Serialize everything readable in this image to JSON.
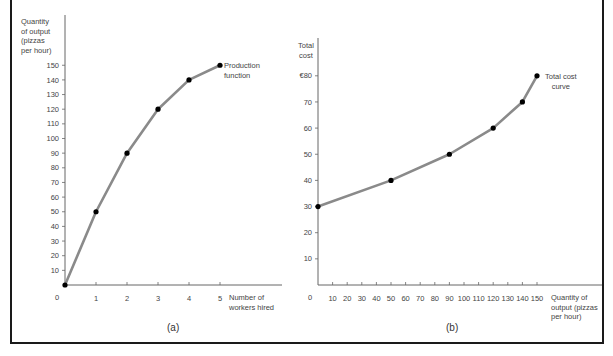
{
  "chart_data": [
    {
      "type": "line",
      "panel": "(a)",
      "title": "",
      "xlabel": "Number of workers hired",
      "ylabel": "Quantity of output (pizzas per hour)",
      "x": [
        0,
        1,
        2,
        3,
        4,
        5
      ],
      "series": [
        {
          "name": "Production function",
          "values": [
            0,
            50,
            90,
            120,
            140,
            150
          ]
        }
      ],
      "x_ticks": [
        "0",
        "1",
        "2",
        "3",
        "4",
        "5"
      ],
      "y_ticks": [
        "10",
        "20",
        "30",
        "40",
        "50",
        "60",
        "70",
        "80",
        "90",
        "100",
        "110",
        "120",
        "130",
        "140",
        "150"
      ],
      "xlim": [
        0,
        6.5
      ],
      "ylim": [
        0,
        160
      ],
      "annotations": [
        "Production function"
      ],
      "grid": false,
      "line_color": "#8a8a8a",
      "marker_color": "#000000"
    },
    {
      "type": "line",
      "panel": "(b)",
      "title": "",
      "xlabel": "Quantity of output (pizzas per hour)",
      "ylabel": "Total cost",
      "x": [
        0,
        50,
        90,
        120,
        140,
        150
      ],
      "series": [
        {
          "name": "Total cost curve",
          "values": [
            30,
            40,
            50,
            60,
            70,
            80
          ]
        }
      ],
      "x_ticks": [
        "0",
        "10",
        "20",
        "30",
        "40",
        "50",
        "60",
        "70",
        "80",
        "90",
        "100",
        "110",
        "120",
        "130",
        "140",
        "150"
      ],
      "y_ticks": [
        "10",
        "20",
        "30",
        "40",
        "50",
        "60",
        "70",
        "€80"
      ],
      "xlim": [
        0,
        195
      ],
      "ylim": [
        0,
        90
      ],
      "y_unit": "€",
      "annotations": [
        "Total cost curve"
      ],
      "grid": false,
      "line_color": "#8a8a8a",
      "marker_color": "#000000"
    }
  ],
  "panel_a": {
    "ylabel_lines": [
      "Quantity",
      "of output",
      "(pizzas",
      "per hour)"
    ],
    "xlabel_lines": [
      "Number of",
      "workers hired"
    ],
    "curve_label_lines": [
      "Production",
      "function"
    ],
    "origin": "0",
    "tag": "(a)"
  },
  "panel_b": {
    "ylabel_lines": [
      "Total",
      "cost"
    ],
    "xlabel_lines": [
      "Quantity of",
      "output (pizzas",
      "per hour)"
    ],
    "curve_label_lines": [
      "Total cost",
      "curve"
    ],
    "origin": "0",
    "tag": "(b)"
  }
}
